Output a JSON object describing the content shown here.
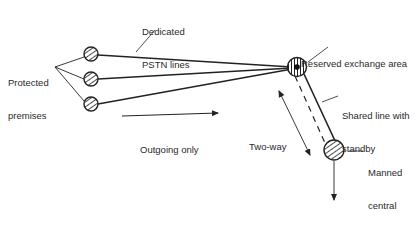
{
  "diagram": {
    "type": "network-schematic",
    "labels": {
      "dedicated_lines_l1": "Dedicated",
      "dedicated_lines_l2": "PSTN lines",
      "protected_premises_l1": "Protected",
      "protected_premises_l2": "premises",
      "reserved_exchange": "Reserved exchange area",
      "shared_line_l1": "Shared line with",
      "shared_line_l2": "standby",
      "outgoing_only": "Outgoing only",
      "two_way": "Two-way",
      "central_station_l1": "Manned",
      "central_station_l2": "central",
      "central_station_l3": "station",
      "response": "Response"
    },
    "nodes": [
      {
        "id": "premises-1",
        "kind": "protected-premises",
        "x": 91,
        "y": 54
      },
      {
        "id": "premises-2",
        "kind": "protected-premises",
        "x": 91,
        "y": 79
      },
      {
        "id": "premises-3",
        "kind": "protected-premises",
        "x": 91,
        "y": 104
      },
      {
        "id": "exchange",
        "kind": "reserved-exchange",
        "x": 297,
        "y": 67
      },
      {
        "id": "central-station",
        "kind": "manned-central-station",
        "x": 333,
        "y": 151
      }
    ],
    "edges": [
      {
        "from": "premises-1",
        "to": "exchange",
        "style": "solid",
        "label": "Dedicated PSTN lines"
      },
      {
        "from": "premises-2",
        "to": "exchange",
        "style": "solid"
      },
      {
        "from": "premises-3",
        "to": "exchange",
        "style": "solid"
      },
      {
        "from": "exchange",
        "to": "central-station",
        "style": "solid+dashed",
        "label": "Shared line with standby"
      }
    ],
    "colors": {
      "stroke": "#222222",
      "text": "#2a2a2a",
      "background": "#ffffff"
    }
  }
}
